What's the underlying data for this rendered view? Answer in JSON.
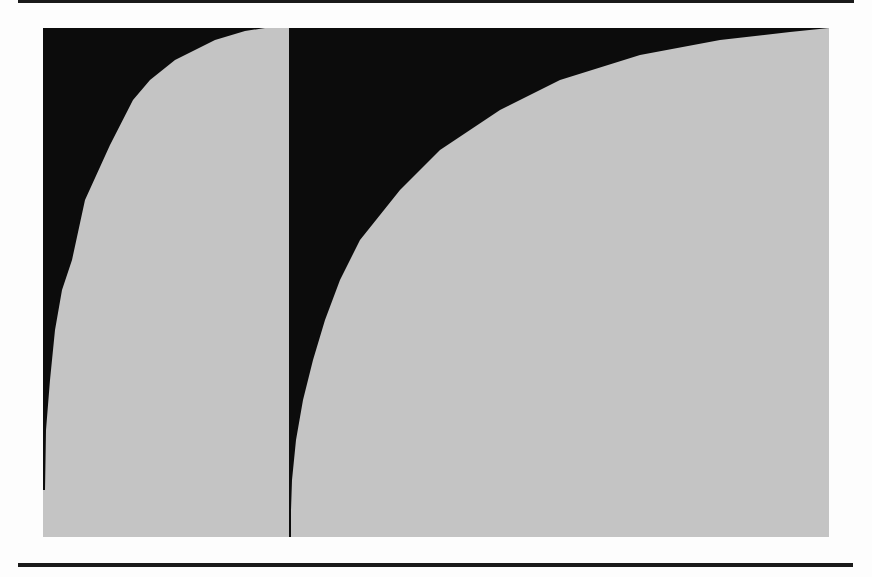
{
  "figure": {
    "colors": {
      "fill_gray": "#c4c4c4",
      "fill_black": "#0c0c0c",
      "rule": "#1a1a1a",
      "background": "#fdfdfd"
    },
    "panels": [
      {
        "name": "left-panel",
        "bounds": {
          "x": 43,
          "y": 28,
          "width": 246,
          "height": 509
        },
        "curve_points": [
          [
            45,
            490
          ],
          [
            46,
            430
          ],
          [
            50,
            380
          ],
          [
            55,
            330
          ],
          [
            62,
            290
          ],
          [
            72,
            260
          ],
          [
            85,
            200
          ],
          [
            110,
            145
          ],
          [
            133,
            100
          ],
          [
            150,
            80
          ],
          [
            175,
            60
          ],
          [
            215,
            40
          ],
          [
            245,
            31
          ],
          [
            265,
            28
          ]
        ]
      },
      {
        "name": "right-panel",
        "bounds": {
          "x": 290,
          "y": 28,
          "width": 539,
          "height": 509
        },
        "curve_points": [
          [
            291,
            510
          ],
          [
            292,
            480
          ],
          [
            296,
            440
          ],
          [
            303,
            400
          ],
          [
            313,
            360
          ],
          [
            325,
            320
          ],
          [
            340,
            280
          ],
          [
            360,
            240
          ],
          [
            400,
            190
          ],
          [
            440,
            150
          ],
          [
            500,
            110
          ],
          [
            560,
            80
          ],
          [
            640,
            55
          ],
          [
            720,
            40
          ],
          [
            790,
            32
          ],
          [
            829,
            28
          ]
        ]
      }
    ],
    "divider": {
      "x": 290,
      "y1": 28,
      "y2": 537
    }
  }
}
